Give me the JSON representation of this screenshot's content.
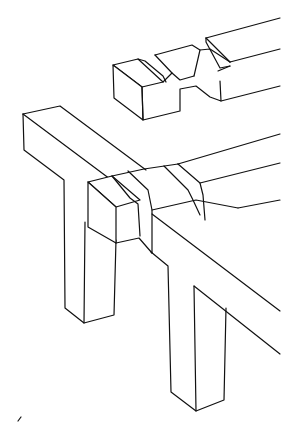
{
  "figure": {
    "type": "line-drawing",
    "subject": "Timber frame joint: notched beam above a post-and-beam corner with wrapped joint",
    "colors": {
      "background": "#ffffff",
      "stroke": "#111111"
    },
    "components": [
      {
        "id": "top-beam",
        "label": "Notched beam with two grooves"
      },
      {
        "id": "left-post",
        "label": "Left post with crossbar"
      },
      {
        "id": "right-post",
        "label": "Right post"
      },
      {
        "id": "long-beam",
        "label": "Long horizontal beam"
      },
      {
        "id": "joint-block",
        "label": "Joint block with two bands"
      }
    ],
    "caption": ""
  }
}
